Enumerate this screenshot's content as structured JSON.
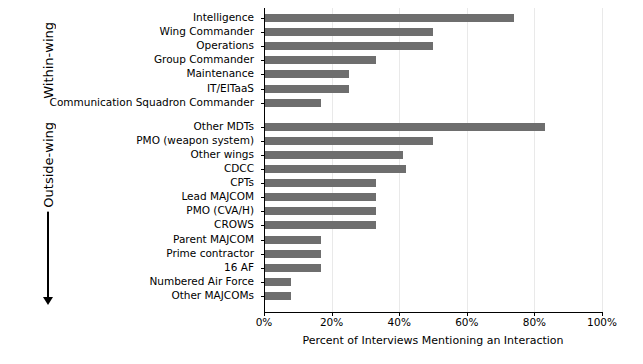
{
  "chart_data": {
    "type": "bar",
    "orientation": "horizontal",
    "title": "",
    "xlabel": "Percent of Interviews Mentioning an Interaction",
    "ylabel": "",
    "xlim": [
      0,
      100
    ],
    "xticks": [
      0,
      20,
      40,
      60,
      80,
      100
    ],
    "xtick_labels": [
      "0%",
      "20%",
      "40%",
      "60%",
      "80%",
      "100%"
    ],
    "grid": true,
    "legend": null,
    "bar_color": "#6e6e6e",
    "groups": [
      {
        "name": "Within-wing",
        "label": "Within-wing",
        "has_arrows": false,
        "categories": [
          "Intelligence",
          "Wing Commander",
          "Operations",
          "Group Commander",
          "Maintenance",
          "IT/EITaaS",
          "Communication Squadron Commander"
        ],
        "values": [
          74,
          50,
          50,
          33,
          25,
          25,
          17
        ]
      },
      {
        "name": "Outside-wing",
        "label": "Outside-wing",
        "has_arrows": true,
        "categories": [
          "Other MDTs",
          "PMO (weapon system)",
          "Other wings",
          "CDCC",
          "CPTs",
          "Lead MAJCOM",
          "PMO (CVA/H)",
          "CROWS",
          "Parent MAJCOM",
          "Prime contractor",
          "16 AF",
          "Numbered Air Force",
          "Other MAJCOMs"
        ],
        "values": [
          83,
          50,
          41,
          42,
          33,
          33,
          33,
          33,
          17,
          17,
          17,
          8,
          8
        ]
      }
    ],
    "categories": [
      "Intelligence",
      "Wing Commander",
      "Operations",
      "Group Commander",
      "Maintenance",
      "IT/EITaaS",
      "Communication Squadron Commander",
      "Other MDTs",
      "PMO (weapon system)",
      "Other wings",
      "CDCC",
      "CPTs",
      "Lead MAJCOM",
      "PMO (CVA/H)",
      "CROWS",
      "Parent MAJCOM",
      "Prime contractor",
      "16 AF",
      "Numbered Air Force",
      "Other MAJCOMs"
    ],
    "values": [
      74,
      50,
      50,
      33,
      25,
      25,
      17,
      83,
      50,
      41,
      42,
      33,
      33,
      33,
      33,
      17,
      17,
      17,
      8,
      8
    ]
  }
}
